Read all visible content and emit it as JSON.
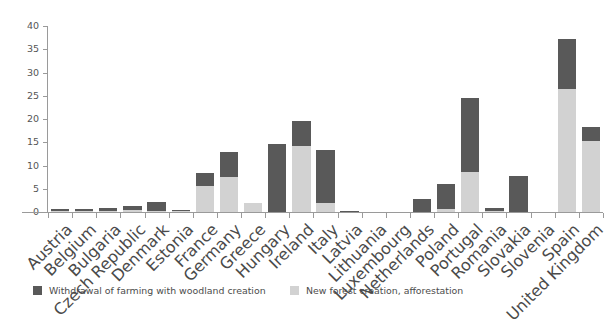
{
  "chart_data": {
    "type": "bar",
    "subtype": "stacked-vertical",
    "title": "",
    "xlabel": "",
    "ylabel": "",
    "ylim": [
      0,
      40
    ],
    "yticks": [
      0,
      5,
      10,
      15,
      20,
      25,
      30,
      35,
      40
    ],
    "grid": false,
    "legend_position": "bottom",
    "categories": [
      "Austria",
      "Belgium",
      "Bulgaria",
      "Czech Republic",
      "Denmark",
      "Estonia",
      "France",
      "Germany",
      "Greece",
      "Hungary",
      "Ireland",
      "Italy",
      "Latvia",
      "Lithuania",
      "Luxembourg",
      "Netherlands",
      "Poland",
      "Portugal",
      "Romania",
      "Slovakia",
      "Slovenia",
      "Spain",
      "United Kingdom"
    ],
    "series": [
      {
        "name": "New forest creation, afforestation",
        "color": "#d2d2d2",
        "values": [
          0.2,
          0.2,
          0.3,
          0.5,
          0.2,
          0.2,
          5.5,
          7.5,
          1.9,
          0.0,
          14.3,
          1.9,
          0.0,
          0.0,
          0.0,
          0.0,
          0.6,
          8.7,
          0.2,
          0.0,
          0.0,
          26.5,
          15.3
        ]
      },
      {
        "name": "Withdrawal of farming with woodland creation",
        "color": "#595959",
        "values": [
          0.5,
          0.4,
          0.5,
          0.8,
          1.9,
          0.3,
          2.8,
          5.5,
          0.0,
          14.7,
          5.2,
          11.4,
          0.3,
          0.0,
          0.0,
          2.7,
          5.4,
          15.8,
          0.7,
          7.8,
          0.0,
          10.8,
          3.0
        ]
      }
    ],
    "totals": [
      0.7,
      0.6,
      0.8,
      1.3,
      2.1,
      0.5,
      8.3,
      13.0,
      1.9,
      14.7,
      19.5,
      13.3,
      0.3,
      0.0,
      0.0,
      2.7,
      6.0,
      24.5,
      0.9,
      7.8,
      0.0,
      37.3,
      18.3
    ]
  },
  "legend": {
    "items": [
      {
        "label": "Withdrawal of farming with woodland creation",
        "color": "#595959"
      },
      {
        "label": "New forest creation, afforestation",
        "color": "#d2d2d2"
      }
    ]
  },
  "axis": {
    "y_tick_labels": [
      "0",
      "5",
      "10",
      "15",
      "20",
      "25",
      "30",
      "35",
      "40"
    ]
  }
}
